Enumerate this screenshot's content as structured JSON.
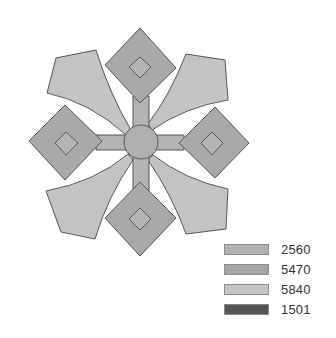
{
  "figure": {
    "colors": {
      "diamond_fill": "#a9a9a9",
      "hub_fill": "#b0b0b0",
      "bar_fill": "#b4b4b4",
      "wing_fill": "#c4c4c4",
      "inner_diamond_fill": "#b5b5b5",
      "stroke": "#555555"
    }
  },
  "legend": {
    "items": [
      {
        "label": "2560",
        "color": "#b2b2b2"
      },
      {
        "label": "5470",
        "color": "#a6a6a6"
      },
      {
        "label": "5840",
        "color": "#c6c6c6"
      },
      {
        "label": "1501",
        "color": "#555555"
      }
    ]
  }
}
